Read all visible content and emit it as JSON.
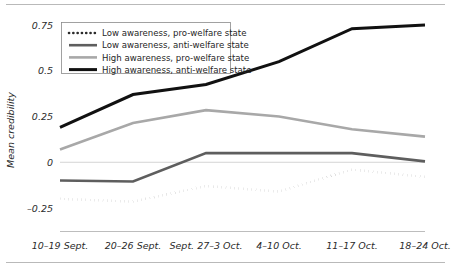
{
  "chart_data": {
    "type": "line",
    "title": "",
    "xlabel": "",
    "ylabel": "Mean credibility",
    "categories": [
      "10–19 Sept.",
      "20–26 Sept.",
      "Sept. 27–3 Oct.",
      "4–10 Oct.",
      "11–17 Oct.",
      "18–24 Oct."
    ],
    "yticks": [
      "0.75",
      "0.5",
      "0.25",
      "0",
      "–0.25"
    ],
    "ytick_values": [
      0.75,
      0.5,
      0.25,
      0,
      -0.25
    ],
    "ylim": [
      -0.3,
      0.82
    ],
    "grid": false,
    "zero_line": true,
    "legend_position": "top-left",
    "series": [
      {
        "name": "Low awareness, pro-welfare state",
        "style": "dotted",
        "color": "#2b2b2b",
        "width": 2.6,
        "values": [
          -0.2,
          -0.215,
          -0.13,
          -0.16,
          -0.04,
          -0.08
        ]
      },
      {
        "name": "Low awareness, anti-welfare state",
        "style": "solid",
        "color": "#5e5e5e",
        "width": 2.6,
        "values": [
          -0.1,
          -0.105,
          0.05,
          0.05,
          0.05,
          0.005
        ]
      },
      {
        "name": "High awareness, pro-welfare state",
        "style": "solid",
        "color": "#a8a8a8",
        "width": 2.6,
        "values": [
          0.07,
          0.215,
          0.285,
          0.25,
          0.18,
          0.14
        ]
      },
      {
        "name": "High awareness, anti-welfare state",
        "style": "solid",
        "color": "#111111",
        "width": 3.0,
        "values": [
          0.19,
          0.37,
          0.425,
          0.55,
          0.73,
          0.75
        ]
      }
    ]
  }
}
